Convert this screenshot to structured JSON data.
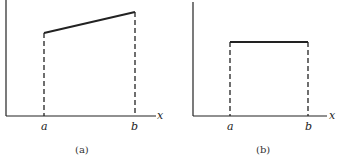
{
  "panels": [
    {
      "id": "a",
      "caption": "(a)",
      "x_axis_label": "x",
      "tick_a": "a",
      "tick_b": "b",
      "shape": "trapezoid (linear increasing top)"
    },
    {
      "id": "b",
      "caption": "(b)",
      "x_axis_label": "x",
      "tick_a": "a",
      "tick_b": "b",
      "shape": "rectangle (constant top)"
    }
  ],
  "colors": {
    "ink": "#222222",
    "background": "#ffffff"
  }
}
